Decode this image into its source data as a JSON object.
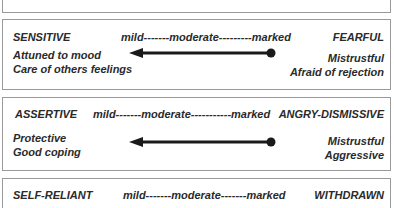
{
  "rows": [
    {
      "left_label": "SENSITIVE",
      "scale": "mild-------moderate---------marked",
      "right_label": "FEARFUL",
      "left_traits": [
        "Attuned to mood",
        "Care of others  feelings"
      ],
      "right_traits": [
        "Mistrustful",
        "Afraid of rejection"
      ]
    },
    {
      "left_label": "ASSERTIVE",
      "scale": "mild-------moderate-----------marked",
      "right_label": "ANGRY-DISMISSIVE",
      "left_traits": [
        "Protective",
        "Good coping"
      ],
      "right_traits": [
        "Mistrustful",
        "Aggressive"
      ]
    },
    {
      "left_label": "SELF-RELIANT",
      "scale": "mild-------moderate-------marked",
      "right_label": "WITHDRAWN"
    }
  ],
  "colors": {
    "border": "#9a9a9a",
    "text": "#2a2a2a",
    "arrow": "#1a1a1a"
  }
}
